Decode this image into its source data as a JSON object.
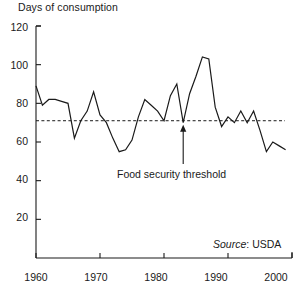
{
  "chart_data": {
    "type": "line",
    "title": "Days of consumption",
    "xlabel": "",
    "ylabel": "Days of consumption",
    "xlim": [
      1960,
      2000
    ],
    "ylim": [
      0,
      120
    ],
    "grid": false,
    "legend_position": "none",
    "x_ticks": [
      1960,
      1970,
      1980,
      1990,
      2000
    ],
    "y_ticks": [
      20,
      40,
      60,
      80,
      100,
      120
    ],
    "x": [
      1960,
      1961,
      1962,
      1963,
      1964,
      1965,
      1966,
      1967,
      1968,
      1969,
      1970,
      1971,
      1972,
      1973,
      1974,
      1975,
      1976,
      1977,
      1978,
      1979,
      1980,
      1981,
      1982,
      1983,
      1984,
      1985,
      1986,
      1987,
      1988,
      1989,
      1990,
      1991,
      1992,
      1993,
      1994,
      1995,
      1996,
      1997,
      1998,
      1999
    ],
    "values": [
      89,
      79,
      82,
      82,
      81,
      80,
      62,
      71,
      76,
      86,
      74,
      70,
      62,
      55,
      56,
      61,
      73,
      82,
      79,
      76,
      71,
      84,
      90,
      70,
      85,
      94,
      104,
      103,
      78,
      68,
      73,
      70,
      76,
      70,
      76,
      66,
      55,
      60,
      58,
      56
    ],
    "series": [
      {
        "name": "Days of consumption",
        "values": [
          89,
          79,
          82,
          82,
          81,
          80,
          62,
          71,
          76,
          86,
          74,
          70,
          62,
          55,
          56,
          61,
          73,
          82,
          79,
          76,
          71,
          84,
          90,
          70,
          85,
          94,
          104,
          103,
          78,
          68,
          73,
          70,
          76,
          70,
          76,
          66,
          55,
          60,
          58,
          56
        ]
      }
    ],
    "threshold": {
      "label": "Food security threshold",
      "value": 71,
      "style": "dashed"
    },
    "annotations": [
      {
        "name": "food-security-threshold",
        "text": "Food security threshold",
        "points_to_year": 1983,
        "points_to_value": 71
      }
    ],
    "source": {
      "prefix": "Source",
      "separator": ": ",
      "value": "USDA",
      "full": "Source: USDA"
    },
    "colors": {
      "line": "#1a1a1a",
      "threshold": "#1a1a1a",
      "axis": "#1a1a1a",
      "background": "#ffffff"
    }
  },
  "axis": {
    "y_title": "Days of consumption",
    "y_tick_labels": [
      "120",
      "100",
      "80",
      "60",
      "40",
      "20"
    ],
    "x_tick_labels": [
      "1960",
      "1970",
      "1980",
      "1990",
      "2000"
    ]
  }
}
